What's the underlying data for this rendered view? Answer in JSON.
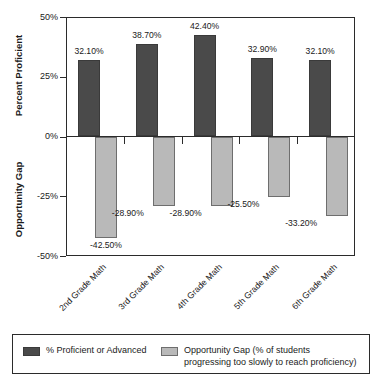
{
  "chart_data": {
    "type": "bar",
    "title": "",
    "xlabel": "",
    "ylabel_top": "Percent Proficient",
    "ylabel_bottom": "Opportunity Gap",
    "ylim": [
      -50,
      50
    ],
    "yticks": [
      50,
      25,
      0,
      -25,
      -50
    ],
    "ytick_labels": [
      "50%",
      "25%",
      "0%",
      "-25%",
      "-50%"
    ],
    "grid": false,
    "legend_position": "bottom",
    "categories": [
      "2nd Grade Math",
      "3rd Grade Math",
      "4th Grade Math",
      "5th Grade Math",
      "6th Grade Math"
    ],
    "series": [
      {
        "name": "% Proficient or Advanced",
        "color": "#4a4a4a",
        "values": [
          32.1,
          38.7,
          42.4,
          32.9,
          32.1
        ],
        "labels": [
          "32.10%",
          "38.70%",
          "42.40%",
          "32.90%",
          "32.10%"
        ]
      },
      {
        "name": "Opportunity Gap (% of students progressing too slowly to reach proficiency)",
        "color": "#b9b9b9",
        "values": [
          -42.5,
          -28.9,
          -28.9,
          -25.5,
          -33.2
        ],
        "labels": [
          "-42.50%",
          "-28.90%",
          "-28.90%",
          "-25.50%",
          "-33.20%"
        ]
      }
    ]
  },
  "legend": {
    "items": [
      {
        "label": "% Proficient or Advanced",
        "swatch": "dark"
      },
      {
        "label": "Opportunity Gap (% of students\nprogressing too slowly to reach proficiency)",
        "swatch": "light"
      }
    ]
  }
}
